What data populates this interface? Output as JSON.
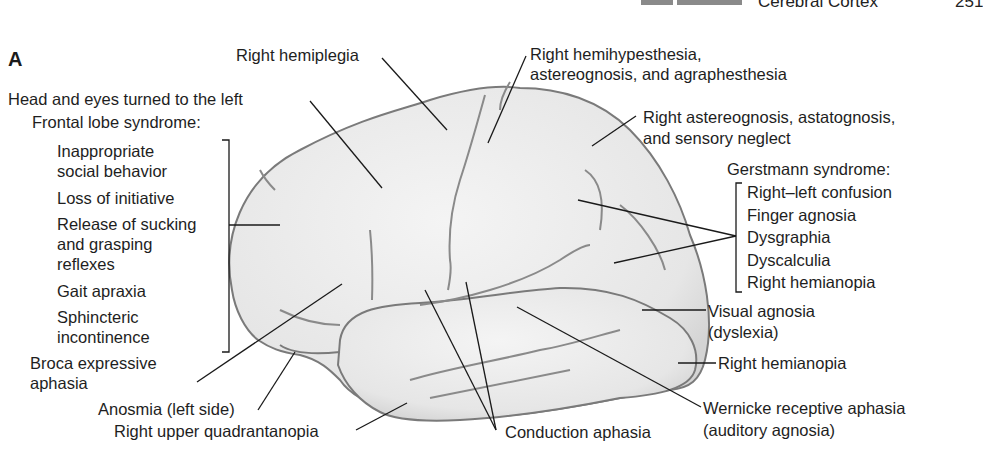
{
  "header": {
    "chapter_label": "Cerebral Cortex",
    "page_number": "251"
  },
  "figure": {
    "panel_label": "A",
    "colors": {
      "brain_fill": "#ececec",
      "brain_outline": "#7a7a7a",
      "leader": "#1a1a1a"
    },
    "labels": {
      "right_hemiplegia": "Right hemiplegia",
      "hemihypesthesia_1": "Right hemihypesthesia,",
      "hemihypesthesia_2": "astereognosis, and agraphesthesia",
      "head_eyes": "Head and eyes turned to the left",
      "astereognosis_1": "Right astereognosis, astatognosis,",
      "astereognosis_2": "and sensory neglect",
      "frontal_title": "Frontal lobe syndrome:",
      "frontal_items": [
        "Inappropriate",
        "social behavior",
        "Loss of initiative",
        "Release of sucking",
        "and grasping",
        "reflexes",
        "Gait apraxia",
        "Sphincteric",
        "incontinence"
      ],
      "gerstmann_title": "Gerstmann syndrome:",
      "gerstmann_items": [
        "Right–left confusion",
        "Finger agnosia",
        "Dysgraphia",
        "Dyscalculia",
        "Right hemianopia"
      ],
      "visual_agnosia_1": "Visual agnosia",
      "visual_agnosia_2": "(dyslexia)",
      "right_hemianopia": "Right hemianopia",
      "broca_1": "Broca expressive",
      "broca_2": "aphasia",
      "anosmia": "Anosmia (left side)",
      "quadrantanopia": "Right upper quadrantanopia",
      "conduction": "Conduction aphasia",
      "wernicke_1": "Wernicke receptive aphasia",
      "wernicke_2": "(auditory agnosia)"
    }
  }
}
